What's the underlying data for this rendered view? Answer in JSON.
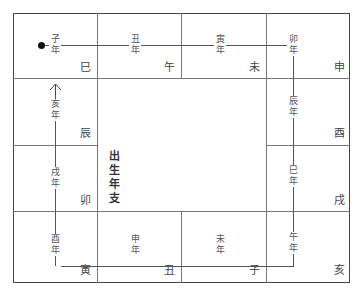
{
  "center": {
    "label": "出生年支",
    "chars": [
      "出",
      "生",
      "年",
      "支"
    ]
  },
  "cells": {
    "r0c0": "巳",
    "r0c1": "午",
    "r0c2": "未",
    "r0c3": "申",
    "r1c3": "酉",
    "r2c3": "戌",
    "r3c3": "亥",
    "r3c2": "子",
    "r3c1": "丑",
    "r3c0": "寅",
    "r2c0": "卯",
    "r1c0": "辰"
  },
  "years": {
    "zi": {
      "top": "子",
      "bottom": "年"
    },
    "chou": {
      "top": "丑",
      "bottom": "年"
    },
    "yin": {
      "top": "寅",
      "bottom": "年"
    },
    "mao": {
      "top": "卯",
      "bottom": "年"
    },
    "chen": {
      "top": "辰",
      "bottom": "年"
    },
    "si": {
      "top": "巳",
      "bottom": "年"
    },
    "wu": {
      "top": "午",
      "bottom": "年"
    },
    "wei": {
      "top": "未",
      "bottom": "年"
    },
    "shen": {
      "top": "申",
      "bottom": "年"
    },
    "you": {
      "top": "酉",
      "bottom": "年"
    },
    "xu": {
      "top": "戌",
      "bottom": "年"
    },
    "hai": {
      "top": "亥",
      "bottom": "年"
    }
  },
  "path": {
    "start_marker": "dot",
    "end_marker": "arrow-up"
  }
}
